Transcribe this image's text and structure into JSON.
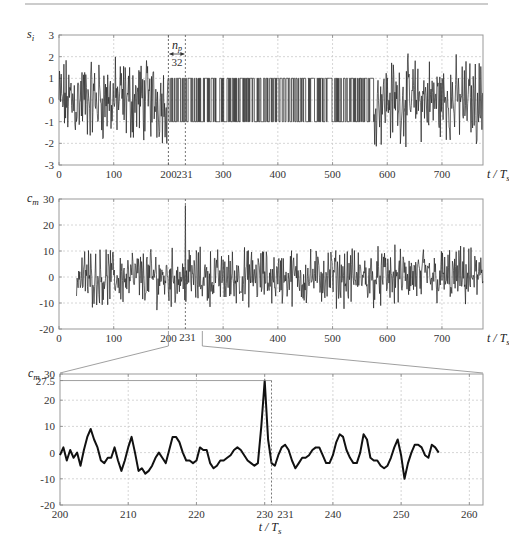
{
  "chart_data": [
    {
      "type": "line",
      "ylabel": "s_i",
      "xlabel": "t/T_s",
      "xlim": [
        0,
        775
      ],
      "ylim": [
        -3,
        3
      ],
      "xticks": [
        0,
        100,
        200,
        300,
        400,
        500,
        600,
        700
      ],
      "yticks": [
        3,
        2,
        1,
        0,
        -1,
        -2,
        -3
      ],
      "grid": true,
      "markers": [
        200,
        231
      ],
      "annotation": {
        "label": "n_p",
        "value": "32",
        "from": 200,
        "to": 231
      },
      "segments": [
        {
          "x_range": [
            0,
            200
          ],
          "kind": "noisy",
          "amplitude": 2.5
        },
        {
          "x_range": [
            200,
            575
          ],
          "kind": "binary",
          "levels": [
            -1,
            1
          ]
        },
        {
          "x_range": [
            575,
            775
          ],
          "kind": "noisy",
          "amplitude": 2.5
        }
      ]
    },
    {
      "type": "line",
      "ylabel": "c_m",
      "xlabel": "t/T_s",
      "xlim": [
        0,
        775
      ],
      "ylim": [
        -20,
        30
      ],
      "xticks": [
        0,
        100,
        200,
        300,
        400,
        500,
        600,
        700
      ],
      "extra_xtick": 231,
      "yticks": [
        30,
        20,
        10,
        0,
        -10,
        -20
      ],
      "grid": true,
      "peak": {
        "x": 231,
        "y": 27.5
      },
      "signal_start": 32,
      "noise_range": [
        -16,
        16
      ]
    },
    {
      "type": "line",
      "ylabel": "c_m",
      "xlabel": "t/T_s",
      "xlim": [
        200,
        262
      ],
      "ylim": [
        -20,
        30
      ],
      "xticks": [
        200,
        210,
        220,
        230,
        240,
        250,
        260
      ],
      "extra_xtick": 231,
      "yticks": [
        30,
        27.5,
        20,
        10,
        0,
        -10,
        -20
      ],
      "grid": true,
      "peak": {
        "x": 231,
        "y": 27.5
      },
      "x": [
        200,
        200.5,
        201,
        201.5,
        202,
        202.5,
        203,
        203.5,
        204,
        204.5,
        205,
        205.5,
        206,
        206.5,
        207,
        207.5,
        208,
        208.5,
        209,
        209.5,
        210,
        210.5,
        211,
        211.5,
        212,
        212.5,
        213,
        213.5,
        214,
        214.5,
        215,
        215.5,
        216,
        216.5,
        217,
        217.5,
        218,
        218.5,
        219,
        219.5,
        220,
        220.5,
        221,
        221.5,
        222,
        222.5,
        223,
        223.5,
        224,
        224.5,
        225,
        225.5,
        226,
        226.5,
        227,
        227.5,
        228,
        228.5,
        229,
        229.5,
        230,
        230.5,
        231,
        231.5,
        232,
        232.5,
        233,
        233.5,
        234,
        234.5,
        235,
        235.5,
        236,
        236.5,
        237,
        237.5,
        238,
        238.5,
        239,
        239.5,
        240,
        240.5,
        241,
        241.5,
        242,
        242.5,
        243,
        243.5,
        244,
        244.5,
        245,
        245.5,
        246,
        246.5,
        247,
        247.5,
        248,
        248.5,
        249,
        249.5,
        250,
        250.5,
        251,
        251.5,
        252,
        252.5,
        253,
        253.5,
        254,
        254.5,
        255,
        255.5,
        256,
        256.5,
        257,
        257.5,
        258,
        258.5,
        259,
        259.5,
        260,
        260.5,
        261,
        261.5,
        262
      ],
      "y": [
        -1,
        2,
        -3,
        1,
        -2,
        0,
        -5,
        1,
        6,
        9,
        5,
        2,
        -3,
        -4,
        -2,
        -2,
        2,
        -3,
        -7,
        -3,
        2,
        6,
        0,
        -7,
        -6,
        -8,
        -7,
        -5,
        -2,
        0,
        -2,
        -4,
        1,
        6,
        6,
        4,
        0,
        -3,
        -3,
        -4,
        -3,
        2,
        1,
        1,
        -4,
        -6,
        -5,
        -3,
        -3,
        -2,
        -1,
        1,
        2,
        1,
        -1,
        -3,
        -4,
        -5,
        -4,
        10,
        27.5,
        5,
        -4,
        -5,
        -1,
        2,
        3,
        1,
        -3,
        -6,
        -4,
        -2,
        -2,
        -1,
        1,
        2,
        2,
        -1,
        -4,
        -4,
        -1,
        4,
        7,
        6,
        1,
        -2,
        -4,
        -4,
        0,
        7,
        5,
        -2,
        -3,
        -3,
        -5,
        -6,
        -5,
        -2,
        2,
        5,
        -1,
        -10,
        -4,
        0,
        3,
        3,
        2,
        -1,
        -2,
        3,
        2,
        0
      ]
    }
  ]
}
